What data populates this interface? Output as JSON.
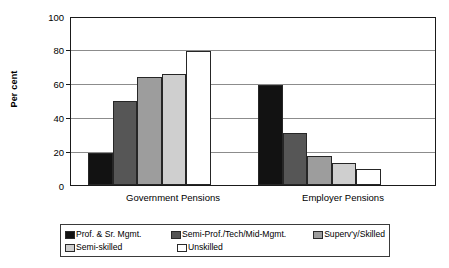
{
  "chart_data": {
    "type": "bar",
    "title": "",
    "xlabel": "",
    "ylabel": "Per cent",
    "ylim": [
      0,
      100
    ],
    "yticks": [
      0,
      20,
      40,
      60,
      80,
      100
    ],
    "ytick_labels": [
      "0",
      "20",
      "40",
      "60",
      "80",
      "100"
    ],
    "grid": true,
    "legend_position": "bottom",
    "categories": [
      "Government Pensions",
      "Employer Pensions"
    ],
    "series": [
      {
        "name": "Prof. & Sr. Mgmt.",
        "color": "#121212",
        "values": [
          19,
          59.5
        ]
      },
      {
        "name": "Semi-Prof./Tech/Mid-Mgmt.",
        "color": "#565656",
        "values": [
          50,
          31
        ]
      },
      {
        "name": "Superv'y/Skilled",
        "color": "#9d9d9d",
        "values": [
          64,
          17.5
        ]
      },
      {
        "name": "Semi-skilled",
        "color": "#cfcfcf",
        "values": [
          66,
          13
        ]
      },
      {
        "name": "Unskilled",
        "color": "#ffffff",
        "values": [
          80,
          9.5
        ]
      }
    ]
  },
  "legend": {
    "rows": [
      [
        "Prof. & Sr. Mgmt.",
        "Semi-Prof./Tech/Mid-Mgmt.",
        "Superv'y/Skilled"
      ],
      [
        "Semi-skilled",
        "Unskilled"
      ]
    ]
  }
}
